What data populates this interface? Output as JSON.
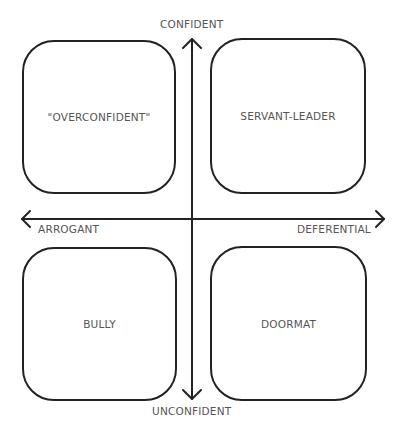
{
  "axes": {
    "top": "CONFIDENT",
    "bottom": "UNCONFIDENT",
    "left": "ARROGANT",
    "right": "DEFERENTIAL"
  },
  "quadrants": {
    "top_left": "\"OVERCONFIDENT\"",
    "top_right": "SERVANT-LEADER",
    "bottom_left": "BULLY",
    "bottom_right": "DOORMAT"
  }
}
